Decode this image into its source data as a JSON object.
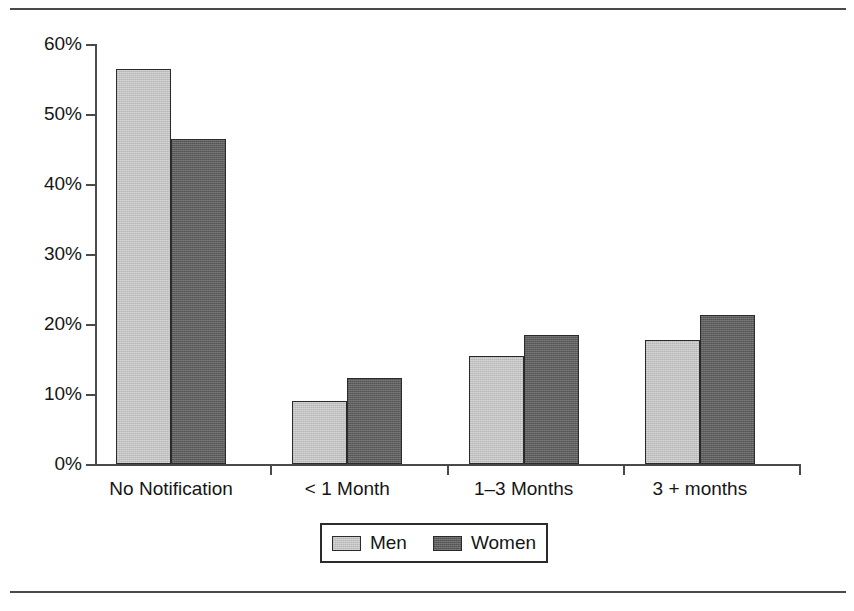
{
  "chart_data": {
    "type": "bar",
    "title": "",
    "subtitle": "",
    "xlabel": "",
    "ylabel": "",
    "categories": [
      "No Notification",
      "< 1 Month",
      "1–3 Months",
      "3 + months"
    ],
    "series": [
      {
        "name": "Men",
        "color": "#c2c2c2",
        "values": [
          56.5,
          9.0,
          15.5,
          17.7
        ]
      },
      {
        "name": "Women",
        "color": "#5e5e5e",
        "values": [
          46.5,
          12.3,
          18.5,
          21.3
        ]
      }
    ],
    "ylim": [
      0,
      60
    ],
    "ytick_values": [
      0,
      10,
      20,
      30,
      40,
      50,
      60
    ],
    "ytick_labels": [
      "0%",
      "10%",
      "20%",
      "30%",
      "40%",
      "50%",
      "60%"
    ],
    "grid": false,
    "legend_position": "bottom-center",
    "legend_entries": [
      "Men",
      "Women"
    ],
    "annotations": []
  },
  "figure": {
    "top_rule": "horizontal-rule",
    "bottom_rule": "horizontal-rule"
  }
}
